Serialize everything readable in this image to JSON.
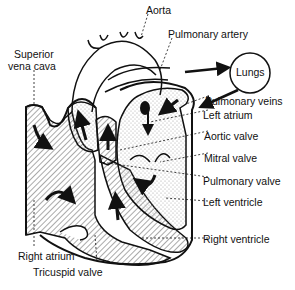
{
  "diagram": {
    "colors": {
      "ink": "#111111",
      "background": "#ffffff",
      "hatch": "#555555",
      "stipple": "#888888"
    },
    "labels": {
      "aorta": "Aorta",
      "pulmonary_artery": "Pulmonary artery",
      "lungs": "Lungs",
      "superior_vena_cava_line1": "Superior",
      "superior_vena_cava_line2": "vena cava",
      "pulmonary_veins": "Pulmonary veins",
      "left_atrium": "Left atrium",
      "aortic_valve": "Aortic valve",
      "mitral_valve": "Mitral valve",
      "pulmonary_valve": "Pulmonary valve",
      "left_ventricle": "Left ventricle",
      "right_ventricle": "Right ventricle",
      "right_atrium": "Right atrium",
      "tricuspid_valve": "Tricuspid valve"
    }
  }
}
